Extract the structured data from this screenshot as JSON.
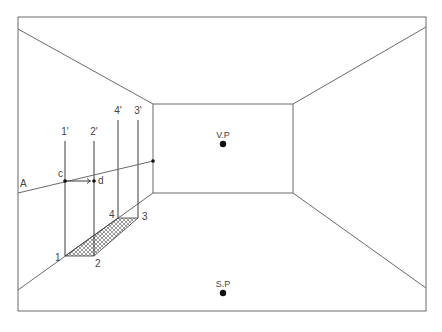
{
  "diagram": {
    "frame": {
      "x1": 18,
      "y1": 17,
      "x2": 426,
      "y2": 311
    },
    "back_wall": {
      "x1": 153,
      "y1": 104,
      "x2": 293,
      "y2": 193
    },
    "corner_lines": [
      {
        "name": "top-left",
        "from": [
          18,
          29
        ],
        "to": [
          153,
          104
        ]
      },
      {
        "name": "top-right",
        "from": [
          426,
          27
        ],
        "to": [
          293,
          104
        ]
      },
      {
        "name": "bottom-left",
        "from": [
          18,
          290
        ],
        "to": [
          153,
          193
        ]
      },
      {
        "name": "bottom-right",
        "from": [
          426,
          288
        ],
        "to": [
          293,
          193
        ]
      }
    ],
    "vanishing_point": {
      "label": "V.P",
      "x": 223,
      "y": 144
    },
    "station_point": {
      "label": "S.P",
      "x": 223,
      "y": 293
    },
    "line_a": {
      "label": "A",
      "from": [
        18,
        193
      ],
      "to": [
        153,
        161
      ],
      "end_dot": [
        153,
        161
      ]
    },
    "verticals": [
      {
        "label": "1'",
        "x": 65,
        "y_top": 141,
        "y_bottom": 256
      },
      {
        "label": "2'",
        "x": 94,
        "y_top": 141,
        "y_bottom": 256
      },
      {
        "label": "4'",
        "x": 118,
        "y_top": 120,
        "y_bottom": 218
      },
      {
        "label": "3'",
        "x": 138,
        "y_top": 120,
        "y_bottom": 218
      }
    ],
    "points": {
      "c": {
        "label": "c",
        "x": 65,
        "y": 181
      },
      "d": {
        "label": "d",
        "x": 94,
        "y": 181
      }
    },
    "floor_rect": {
      "hatch": "crosshatch",
      "corners": [
        {
          "label": "1",
          "x": 65,
          "y": 256
        },
        {
          "label": "2",
          "x": 94,
          "y": 256
        },
        {
          "label": "3",
          "x": 138,
          "y": 218
        },
        {
          "label": "4",
          "x": 118,
          "y": 218
        }
      ]
    },
    "colors": {
      "line": "#6a6a6a",
      "dark": "#3a3a3a",
      "dot": "#111111",
      "text": "#444444"
    }
  }
}
